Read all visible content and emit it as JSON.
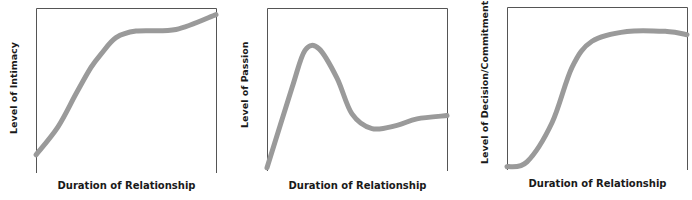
{
  "chart_data": [
    {
      "type": "line",
      "title": "",
      "xlabel": "Duration of Relationship",
      "ylabel": "Level of Intimacy",
      "axis_ticks": false,
      "grid": false,
      "series": [
        {
          "name": "Intimacy",
          "color": "#9a9a9a",
          "x": [
            0,
            22,
            40,
            55,
            65,
            80,
            100,
            140,
            180
          ],
          "y": [
            0.11,
            0.28,
            0.48,
            0.64,
            0.72,
            0.82,
            0.86,
            0.87,
            0.96
          ]
        }
      ]
    },
    {
      "type": "line",
      "title": "",
      "xlabel": "Duration of Relationship",
      "ylabel": "Level of Passion",
      "axis_ticks": false,
      "grid": false,
      "series": [
        {
          "name": "Passion",
          "color": "#9a9a9a",
          "x": [
            0,
            25,
            38,
            52,
            70,
            85,
            105,
            130,
            150,
            180
          ],
          "y": [
            0.02,
            0.51,
            0.74,
            0.75,
            0.57,
            0.35,
            0.26,
            0.28,
            0.32,
            0.34
          ]
        }
      ]
    },
    {
      "type": "line",
      "title": "",
      "xlabel": "Duration of Relationship",
      "ylabel": "Level of Decision/Commitment",
      "axis_ticks": false,
      "grid": false,
      "series": [
        {
          "name": "Decision/Commitment",
          "color": "#9a9a9a",
          "x": [
            0,
            20,
            45,
            65,
            85,
            120,
            160,
            180
          ],
          "y": [
            0.02,
            0.05,
            0.29,
            0.63,
            0.79,
            0.85,
            0.85,
            0.83
          ]
        }
      ]
    }
  ],
  "panels": [
    {
      "ylabel": "Level of Intimacy",
      "xlabel": "Duration of Relationship"
    },
    {
      "ylabel": "Level of Passion",
      "xlabel": "Duration of Relationship"
    },
    {
      "ylabel": "Level of Decision/Commitment",
      "xlabel": "Duration of Relationship"
    }
  ]
}
